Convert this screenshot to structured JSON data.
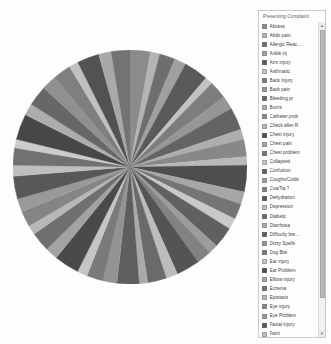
{
  "legend": {
    "title": "Presenting Complaint",
    "scrollbar": {
      "up_arrow": "▲",
      "down_arrow": "▼"
    }
  },
  "chart_data": {
    "type": "pie",
    "title": "Presenting Complaint",
    "legend_position": "right",
    "legend_title": "Presenting Complaint",
    "grid": false,
    "palette_mode": "grayscale",
    "start_angle_deg": -90,
    "direction": "clockwise",
    "categories": [
      "Abcess",
      "Abdo pain",
      "Allergic Reac...",
      "Ankle inj",
      "Arm injury",
      "Asthmatic",
      "Back Injury",
      "Back pain",
      "Bleeding pr",
      "Burns",
      "Catheter prob",
      "Check after R.",
      "Chest injury",
      "Chest pain",
      "Chest problem",
      "Collapsed",
      "Confusion",
      "Coughs/Colds",
      "Cva/Tia ?",
      "Dehydration",
      "Depression",
      "Diabetic",
      "Diarrhoea",
      "Difficulty bre...",
      "Dizzy Spells",
      "Dog Bite",
      "Ear injury",
      "Ear Problem",
      "Elbow injury",
      "Eczema",
      "Epistaxis",
      "Eye injury",
      "Eye Problem",
      "Facial injury",
      "Faint",
      "Finger injury",
      "Fits",
      "Foot injury",
      "Generally un...",
      "GI bleed",
      "Groin pain",
      "Hand injury",
      "Head injury",
      "High Temper...",
      "Hip inj",
      "Insect bite"
    ],
    "values": [
      2.6,
      1.2,
      2.0,
      1.5,
      3.1,
      1.0,
      2.3,
      1.7,
      2.9,
      1.3,
      2.2,
      1.1,
      3.4,
      1.6,
      2.0,
      1.4,
      2.7,
      1.2,
      1.9,
      3.0,
      1.5,
      2.4,
      1.1,
      2.8,
      1.8,
      2.1,
      1.3,
      3.2,
      1.6,
      2.5,
      1.2,
      2.0,
      1.7,
      2.9,
      1.4,
      2.2,
      1.1,
      3.3,
      1.5,
      2.6,
      1.9,
      2.3,
      1.2,
      2.8,
      1.6,
      2.4
    ],
    "colors": [
      "#8c8c8c",
      "#b4b4b4",
      "#6e6e6e",
      "#a0a0a0",
      "#5a5a5a",
      "#c2c2c2",
      "#7d7d7d",
      "#969696",
      "#646464",
      "#aeaeae",
      "#888888",
      "#b9b9b9",
      "#4e4e4e",
      "#a6a6a6",
      "#757575",
      "#c8c8c8",
      "#606060",
      "#9c9c9c",
      "#828282",
      "#545454",
      "#bcbcbc",
      "#6a6a6a",
      "#aaaaaa",
      "#5e5e5e",
      "#939393",
      "#7a7a7a",
      "#c5c5c5",
      "#4a4a4a",
      "#a3a3a3",
      "#6f6f6f",
      "#b7b7b7",
      "#858585",
      "#999999",
      "#585858",
      "#bfbfbf",
      "#717171",
      "#cbcbcb",
      "#474747",
      "#adadad",
      "#676767",
      "#909090",
      "#7f7f7f",
      "#c0c0c0",
      "#525252",
      "#a9a9a9",
      "#737373"
    ]
  }
}
